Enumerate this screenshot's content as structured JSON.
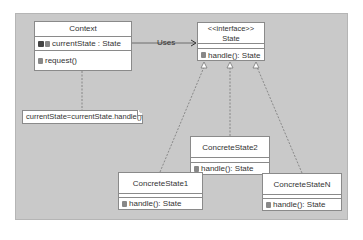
{
  "diagram": {
    "type": "uml-class",
    "classes": {
      "context": {
        "name": "Context",
        "attributes": [
          "currentState : State"
        ],
        "operations": [
          "request()"
        ]
      },
      "state": {
        "stereotype": "<<interface>>",
        "name": "State",
        "operations": [
          "handle(): State"
        ]
      },
      "concrete1": {
        "name": "ConcreteState1",
        "operations": [
          "handle(): State"
        ]
      },
      "concrete2": {
        "name": "ConcreteState2",
        "operations": [
          "handle(): State"
        ]
      },
      "concreteN": {
        "name": "ConcreteStateN",
        "operations": [
          "handle(): State"
        ]
      }
    },
    "note": {
      "text": "currentState=currentState.handle()"
    },
    "relations": [
      {
        "from": "Context",
        "to": "State",
        "type": "association",
        "label": "Uses"
      },
      {
        "from": "ConcreteState1",
        "to": "State",
        "type": "realization"
      },
      {
        "from": "ConcreteState2",
        "to": "State",
        "type": "realization"
      },
      {
        "from": "ConcreteStateN",
        "to": "State",
        "type": "realization"
      },
      {
        "from": "Context",
        "to": "note",
        "type": "note-anchor"
      }
    ]
  }
}
